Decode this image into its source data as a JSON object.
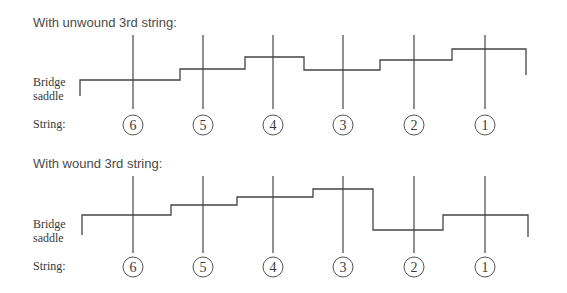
{
  "panels": [
    {
      "title": "With unwound 3rd string:",
      "saddle_label_line1": "Bridge",
      "saddle_label_line2": "saddle",
      "string_label": "String:",
      "strings": [
        "6",
        "5",
        "4",
        "3",
        "2",
        "1"
      ],
      "saddle_heights_description": "stepped profile rising from string 6 to 4, dropping at 3, rising again through 2 and 1"
    },
    {
      "title": "With wound 3rd string:",
      "saddle_label_line1": "Bridge",
      "saddle_label_line2": "saddle",
      "string_label": "String:",
      "strings": [
        "6",
        "5",
        "4",
        "3",
        "2",
        "1"
      ],
      "saddle_heights_description": "stepped profile rising from string 6 to 3, dropping sharply at 2, rising at 1"
    }
  ]
}
